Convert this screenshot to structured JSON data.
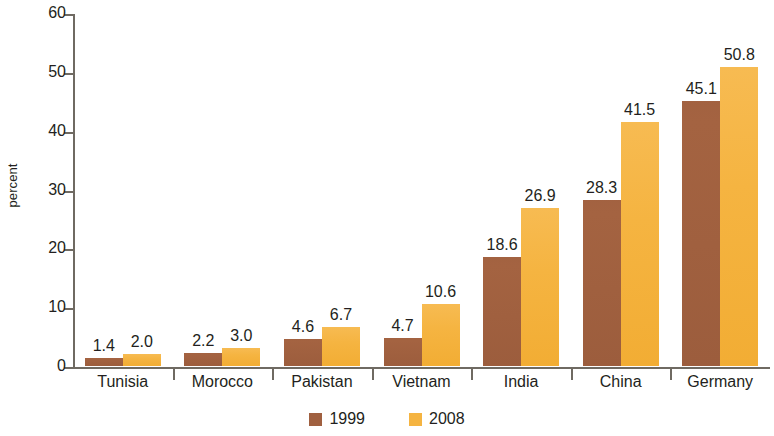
{
  "chart_data": {
    "type": "bar",
    "title": "",
    "subtitle": "",
    "xlabel": "",
    "ylabel": "percent",
    "ylim": [
      0,
      60
    ],
    "ytick_step": 10,
    "yticks": [
      "60",
      "50",
      "40",
      "30",
      "20",
      "10",
      "0"
    ],
    "grid": false,
    "legend_position": "bottom-center",
    "categories": [
      "Tunisia",
      "Morocco",
      "Pakistan",
      "Vietnam",
      "India",
      "China",
      "Germany"
    ],
    "series": [
      {
        "name": "1999",
        "color": "#a06040",
        "values": [
          1.4,
          2.2,
          4.6,
          4.7,
          18.6,
          28.3,
          45.1
        ],
        "labels": [
          "1.4",
          "2.2",
          "4.6",
          "4.7",
          "18.6",
          "28.3",
          "45.1"
        ]
      },
      {
        "name": "2008",
        "color": "#f5b441",
        "values": [
          2.0,
          3.0,
          6.7,
          10.6,
          26.9,
          41.5,
          50.8
        ],
        "labels": [
          "2.0",
          "3.0",
          "6.7",
          "10.6",
          "26.9",
          "41.5",
          "50.8"
        ]
      }
    ]
  },
  "colors": {
    "series_1999": "#a06040",
    "series_2008": "#f5b441",
    "axis": "#6f6a62",
    "text": "#231f20",
    "background": "#ffffff"
  }
}
